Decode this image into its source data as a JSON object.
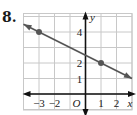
{
  "problem": {
    "number": "8."
  },
  "chart_data": {
    "type": "line",
    "title": "",
    "xlabel": "x",
    "ylabel": "y",
    "origin_label": "O",
    "xlim": [
      -4,
      3
    ],
    "ylim": [
      -1,
      5
    ],
    "grid": true,
    "x_tick_labels": [
      "−3",
      "−2",
      "1",
      "2"
    ],
    "x_ticks": [
      -3,
      -2,
      1,
      2
    ],
    "y_tick_labels": [
      "4",
      "2",
      "1"
    ],
    "y_ticks": [
      4,
      2,
      1
    ],
    "series": [
      {
        "name": "line",
        "equation": "y = -1/2 x + 5/2",
        "points": [
          [
            -3,
            4
          ],
          [
            1,
            2
          ]
        ],
        "extent": [
          [
            -4,
            4.5
          ],
          [
            3,
            1
          ]
        ],
        "arrows": "both",
        "color": "#555555"
      }
    ],
    "colors": {
      "grid": "#c8c8c8",
      "axis": "#111111",
      "line": "#555555",
      "point": "#555555"
    }
  }
}
